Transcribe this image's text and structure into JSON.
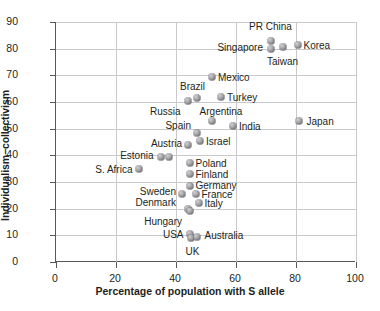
{
  "chart_data": {
    "type": "scatter",
    "title": "",
    "xlabel": "Percentage of population with S allele",
    "ylabel": "Individualism−collectivism",
    "xlim": [
      0,
      100
    ],
    "ylim": [
      0,
      90
    ],
    "xticks": [
      "0",
      "20",
      "40",
      "60",
      "80",
      "100"
    ],
    "yticks": [
      "0",
      "10",
      "20",
      "30",
      "40",
      "50",
      "60",
      "70",
      "80",
      "90"
    ],
    "grid": true,
    "legend": "none",
    "marker_color": "#8a8a8f",
    "axis_color": "#58585a",
    "grid_color": "#c9c9cb",
    "points": [
      {
        "label": "PR China",
        "x": 71.5,
        "y": 83.0,
        "lx": 71.5,
        "ly": 88.5,
        "anchor": "c"
      },
      {
        "label": "Singapore",
        "x": 71.5,
        "y": 80.0,
        "lx": 69.0,
        "ly": 80.5,
        "anchor": "l"
      },
      {
        "label": "Taiwan",
        "x": 75.5,
        "y": 80.5,
        "lx": 75.5,
        "ly": 75.5,
        "anchor": "c"
      },
      {
        "label": "Korea",
        "x": 80.5,
        "y": 81.5,
        "lx": 82.5,
        "ly": 81.5,
        "anchor": "r"
      },
      {
        "label": "Mexico",
        "x": 52.0,
        "y": 69.5,
        "lx": 54.0,
        "ly": 69.5,
        "anchor": "r"
      },
      {
        "label": "Brazil",
        "x": 47.0,
        "y": 61.5,
        "lx": 45.5,
        "ly": 66.0,
        "anchor": "c"
      },
      {
        "label": "Turkey",
        "x": 55.0,
        "y": 62.0,
        "lx": 57.0,
        "ly": 62.0,
        "anchor": "r"
      },
      {
        "label": "Russia",
        "x": 44.0,
        "y": 60.5,
        "lx": 41.5,
        "ly": 56.5,
        "anchor": "l"
      },
      {
        "label": "Argentina",
        "x": 52.0,
        "y": 53.0,
        "lx": 55.0,
        "ly": 56.5,
        "anchor": "c"
      },
      {
        "label": "India",
        "x": 59.0,
        "y": 51.0,
        "lx": 61.0,
        "ly": 51.0,
        "anchor": "r"
      },
      {
        "label": "Japan",
        "x": 81.0,
        "y": 53.0,
        "lx": 83.5,
        "ly": 53.0,
        "anchor": "r"
      },
      {
        "label": "Spain",
        "x": 47.0,
        "y": 48.5,
        "lx": 45.0,
        "ly": 51.5,
        "anchor": "l"
      },
      {
        "label": "Israel",
        "x": 48.0,
        "y": 45.5,
        "lx": 50.0,
        "ly": 45.5,
        "anchor": "r"
      },
      {
        "label": "Austria",
        "x": 44.0,
        "y": 44.0,
        "lx": 42.0,
        "ly": 44.5,
        "anchor": "l"
      },
      {
        "label": "Estonia",
        "x": 35.0,
        "y": 39.5,
        "lx": 32.5,
        "ly": 40.0,
        "anchor": "l"
      },
      {
        "label": "",
        "x": 37.5,
        "y": 39.5,
        "lx": 0,
        "ly": 0,
        "anchor": "c"
      },
      {
        "label": "S. Africa",
        "x": 27.5,
        "y": 35.0,
        "lx": 25.5,
        "ly": 35.0,
        "anchor": "l"
      },
      {
        "label": "Poland",
        "x": 44.5,
        "y": 37.0,
        "lx": 46.5,
        "ly": 37.0,
        "anchor": "r"
      },
      {
        "label": "Finland",
        "x": 44.5,
        "y": 33.0,
        "lx": 46.5,
        "ly": 33.0,
        "anchor": "r"
      },
      {
        "label": "Germany",
        "x": 44.5,
        "y": 28.5,
        "lx": 46.5,
        "ly": 29.0,
        "anchor": "r"
      },
      {
        "label": "Sweden",
        "x": 42.0,
        "y": 25.5,
        "lx": 40.0,
        "ly": 26.5,
        "anchor": "l"
      },
      {
        "label": "France",
        "x": 46.5,
        "y": 25.5,
        "lx": 48.5,
        "ly": 25.5,
        "anchor": "r"
      },
      {
        "label": "Italy",
        "x": 47.5,
        "y": 22.0,
        "lx": 49.5,
        "ly": 22.0,
        "anchor": "r"
      },
      {
        "label": "Denmark",
        "x": 44.0,
        "y": 20.0,
        "lx": 40.0,
        "ly": 22.5,
        "anchor": "l"
      },
      {
        "label": "Hungary",
        "x": 44.5,
        "y": 19.0,
        "lx": 42.0,
        "ly": 15.5,
        "anchor": "l"
      },
      {
        "label": "USA",
        "x": 44.5,
        "y": 10.5,
        "lx": 42.5,
        "ly": 10.5,
        "anchor": "l"
      },
      {
        "label": "UK",
        "x": 45.0,
        "y": 9.0,
        "lx": 45.5,
        "ly": 4.0,
        "anchor": "c"
      },
      {
        "label": "Australia",
        "x": 47.0,
        "y": 9.5,
        "lx": 49.5,
        "ly": 10.0,
        "anchor": "r"
      }
    ]
  }
}
